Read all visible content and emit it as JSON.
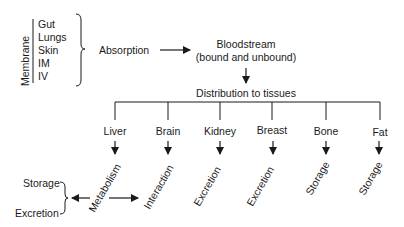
{
  "membrane": {
    "label": "Membrane",
    "routes": [
      "Gut",
      "Lungs",
      "Skin",
      "IM",
      "IV"
    ]
  },
  "absorption": "Absorption",
  "bloodstream": {
    "line1": "Bloodstream",
    "line2": "(bound and unbound)"
  },
  "distribution": "Distribution to tissues",
  "tissues": [
    {
      "name": "Liver",
      "fate": "Metabolism"
    },
    {
      "name": "Brain",
      "fate": "Interaction"
    },
    {
      "name": "Kidney",
      "fate": "Excretion"
    },
    {
      "name": "Breast",
      "fate": "Excretion"
    },
    {
      "name": "Bone",
      "fate": "Storage"
    },
    {
      "name": "Fat",
      "fate": "Storage"
    }
  ],
  "metabolism_outputs": [
    "Storage",
    "Excretion"
  ],
  "line_color": "#1a1a1a"
}
